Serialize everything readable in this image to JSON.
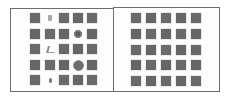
{
  "figure": {
    "panels": [
      {
        "id": "left",
        "description": "5x5 grid of gray squares with several anomalous cells (faint marks / blobs)",
        "rows": 5,
        "cols": 5,
        "cells": [
          [
            "square",
            "faint-mark",
            "square",
            "square",
            "square"
          ],
          [
            "square",
            "square",
            "square",
            "flower-blob",
            "square"
          ],
          [
            "square",
            "glyph-mark",
            "square",
            "square",
            "square"
          ],
          [
            "square",
            "square",
            "square",
            "round-blob",
            "square"
          ],
          [
            "square",
            "dot-mark",
            "square",
            "square",
            "square"
          ]
        ]
      },
      {
        "id": "right",
        "description": "5x5 grid of uniform gray squares",
        "rows": 5,
        "cols": 5,
        "cells": [
          [
            "square",
            "square",
            "square",
            "square",
            "square"
          ],
          [
            "square",
            "square",
            "square",
            "square",
            "square"
          ],
          [
            "square",
            "square",
            "square",
            "square",
            "square"
          ],
          [
            "square",
            "square",
            "square",
            "square",
            "square"
          ],
          [
            "square",
            "square",
            "square",
            "square",
            "square"
          ]
        ]
      }
    ],
    "colors": {
      "square": "#6a6a6a",
      "border": "#6e6e6e",
      "background": "#ffffff"
    }
  }
}
